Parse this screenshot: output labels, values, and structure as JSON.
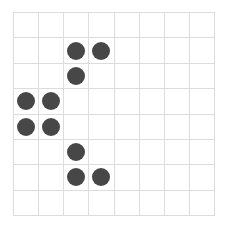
{
  "board": {
    "rows": 8,
    "cols": 8,
    "grid_color": "#dcdcdc",
    "stone_color": "#474747",
    "stones": [
      {
        "row": 1,
        "col": 2
      },
      {
        "row": 1,
        "col": 3
      },
      {
        "row": 2,
        "col": 2
      },
      {
        "row": 3,
        "col": 0
      },
      {
        "row": 3,
        "col": 1
      },
      {
        "row": 4,
        "col": 0
      },
      {
        "row": 4,
        "col": 1
      },
      {
        "row": 5,
        "col": 2
      },
      {
        "row": 6,
        "col": 2
      },
      {
        "row": 6,
        "col": 3
      }
    ]
  }
}
